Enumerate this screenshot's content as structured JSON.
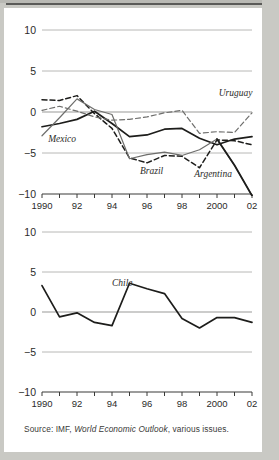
{
  "figure": {
    "source_note_prefix": "Source: IMF,",
    "source_note_italic": "World Economic Outlook",
    "source_note_suffix": ", various issues."
  },
  "colors": {
    "paper": "#ffffff",
    "page_margin": "#c9c9c4",
    "gridline": "#b0b0ae",
    "axis": "#3a3a38",
    "series_dark": "#1d1d1b",
    "series_gray": "#6e6e6c",
    "text": "#2b2b29"
  },
  "chart_data": [
    {
      "id": "panel-top",
      "type": "line",
      "title": "",
      "xlabel": "",
      "ylabel": "",
      "x": [
        1990,
        1991,
        1992,
        1993,
        1994,
        1995,
        1996,
        1997,
        1998,
        1999,
        2000,
        2001,
        2002
      ],
      "xlim": [
        1990,
        2002
      ],
      "ylim": [
        -10,
        10
      ],
      "yticks": [
        10,
        5,
        0,
        -5,
        -10
      ],
      "ytick_labels": [
        "10",
        "5",
        "0",
        "−5",
        "−10"
      ],
      "xticks": [
        1990,
        1991,
        1992,
        1993,
        1994,
        1995,
        1996,
        1997,
        1998,
        1999,
        2000,
        2001,
        2002
      ],
      "xtick_labels": [
        "1990",
        "",
        "92",
        "",
        "94",
        "",
        "96",
        "",
        "98",
        "",
        "2000",
        "",
        "02"
      ],
      "grid": "horizontal",
      "legend": "inline-annotations",
      "series": [
        {
          "name": "Mexico",
          "style": "solid-dark",
          "label_x": 1990.35,
          "label_y": -3.7,
          "values": [
            -1.8,
            -1.4,
            -0.9,
            0.1,
            -1.4,
            -3.0,
            -2.8,
            -2.1,
            -2.0,
            -3.2,
            -4.0,
            -3.3,
            -3.0
          ]
        },
        {
          "name": "Brazil",
          "style": "dashed-dark",
          "label_x": 1995.6,
          "label_y": -7.6,
          "values": [
            1.5,
            1.4,
            2.0,
            -0.2,
            -2.0,
            -5.6,
            -6.2,
            -5.3,
            -5.4,
            -6.8,
            -3.4,
            -3.5,
            -4.0
          ]
        },
        {
          "name": "Uruguay",
          "style": "dashed-gray",
          "label_x": 2000.1,
          "label_y": 2.0,
          "values": [
            0.2,
            0.7,
            0.1,
            -0.6,
            -1.0,
            -0.9,
            -0.6,
            -0.1,
            0.2,
            -2.6,
            -2.4,
            -2.5,
            -0.1
          ]
        },
        {
          "name": "Argentina",
          "style": "solid-gray-to-black",
          "label_x": 1998.7,
          "label_y": -7.9,
          "values": [
            -2.9,
            -0.7,
            1.6,
            0.3,
            -0.3,
            -5.7,
            -5.2,
            -4.9,
            -5.3,
            -4.6,
            -3.3,
            -6.5,
            -10.2
          ]
        }
      ]
    },
    {
      "id": "panel-bottom",
      "type": "line",
      "title": "",
      "xlabel": "",
      "ylabel": "",
      "x": [
        1990,
        1991,
        1992,
        1993,
        1994,
        1995,
        1996,
        1997,
        1998,
        1999,
        2000,
        2001,
        2002
      ],
      "xlim": [
        1990,
        2002
      ],
      "ylim": [
        -10,
        10
      ],
      "yticks": [
        10,
        5,
        0,
        -5,
        -10
      ],
      "ytick_labels": [
        "10",
        "5",
        "0",
        "−5",
        "−10"
      ],
      "xticks": [
        1990,
        1991,
        1992,
        1993,
        1994,
        1995,
        1996,
        1997,
        1998,
        1999,
        2000,
        2001,
        2002
      ],
      "xtick_labels": [
        "1990",
        "",
        "92",
        "",
        "94",
        "",
        "96",
        "",
        "98",
        "",
        "2000",
        "",
        "02"
      ],
      "grid": "horizontal",
      "legend": "inline-annotations",
      "series": [
        {
          "name": "Chile",
          "style": "solid-dark",
          "label_x": 1994.0,
          "label_y": 3.3,
          "values": [
            3.3,
            -0.6,
            -0.1,
            -1.3,
            -1.7,
            3.6,
            2.9,
            2.3,
            -0.8,
            -2.0,
            -0.7,
            -0.7,
            -1.3
          ]
        }
      ]
    }
  ]
}
